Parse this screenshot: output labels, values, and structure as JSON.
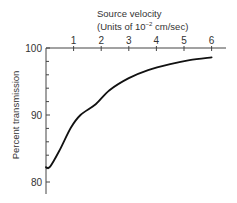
{
  "chart_data": {
    "type": "line",
    "title": "Source velocity",
    "xlabel": "(Units of 10^-2 cm/sec)",
    "xlabel_parts": {
      "prefix": "(Units of 10",
      "exponent": "−2",
      "suffix": " cm/sec)"
    },
    "ylabel": "Percent transmission",
    "x_axis_position": "top",
    "xlim": [
      0,
      6.5
    ],
    "ylim": [
      78.2,
      100
    ],
    "x_ticks": [
      1,
      2,
      3,
      4,
      5,
      6
    ],
    "y_major_ticks": [
      80,
      90,
      100
    ],
    "y_minor_ticks": [
      82,
      84,
      86,
      88,
      92,
      94,
      96,
      98
    ],
    "grid": false,
    "legend": null,
    "series": [
      {
        "name": "Percent transmission",
        "color": "#111111",
        "x": [
          0,
          0.15,
          0.5,
          0.9,
          1.25,
          1.8,
          2.3,
          3.0,
          3.7,
          4.5,
          5.2,
          6.0
        ],
        "y": [
          82.2,
          82.3,
          84.8,
          88.1,
          90.0,
          91.6,
          93.7,
          95.5,
          96.7,
          97.6,
          98.2,
          98.6
        ]
      }
    ]
  }
}
